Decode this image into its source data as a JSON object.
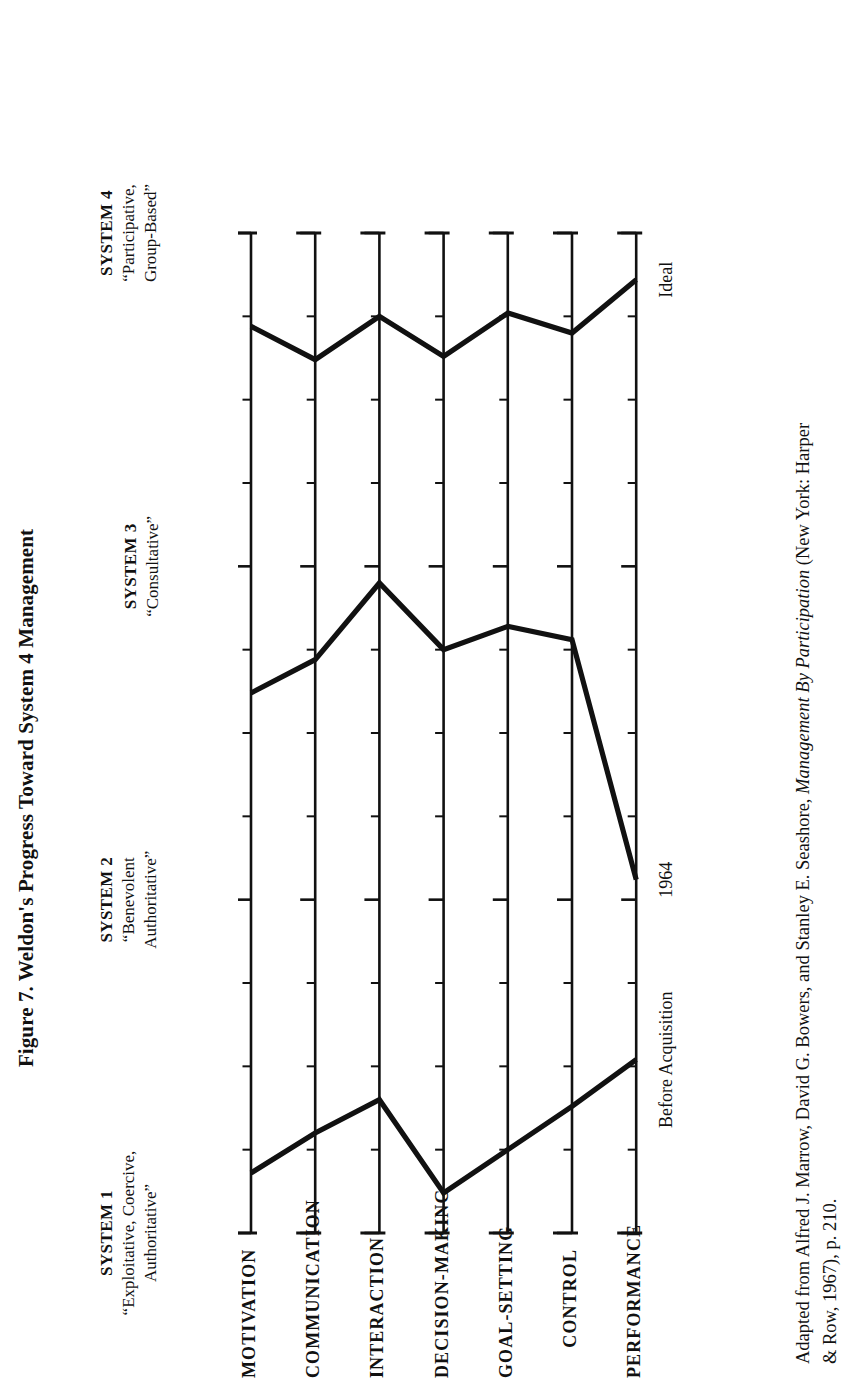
{
  "figure": {
    "title": "Figure 7. Weldon's Progress Toward System 4 Management",
    "orientation": "rotated-90-ccw",
    "ink_color": "#111111",
    "background_color": "#ffffff"
  },
  "systems": [
    {
      "name": "SYSTEM 1",
      "descriptor": "“Exploitative, Coercive,\nAuthoritative”"
    },
    {
      "name": "SYSTEM 2",
      "descriptor": "“Benevolent\nAuthoritative”"
    },
    {
      "name": "SYSTEM 3",
      "descriptor": "“Consultative”"
    },
    {
      "name": "SYSTEM 4",
      "descriptor": "“Participative,\nGroup-Based”"
    }
  ],
  "series_labels": {
    "ideal": "Ideal",
    "year_1964": "1964",
    "before_acquisition": "Before Acquisition"
  },
  "source": {
    "line1": "Adapted from Alfred J. Marrow, David G. Bowers, and Stanley E. Seashore, ",
    "line1_italic": "Management By Participation",
    "line1_tail": " (New York: Harper",
    "line2": "& Row, 1967), p. 210."
  },
  "chart_data": {
    "type": "line",
    "title": "Figure 7. Weldon's Progress Toward System 4 Management",
    "xlabel": "",
    "ylabel": "",
    "orientation": "horizontal-profile",
    "note": "Likert System 1-4 organizational profile. The value axis runs 1.0 (System 1) to 4.0 (System 4) and is drawn horizontally for each variable row; each row is a separate vertical scale in the rotated scan.",
    "xlim": [
      1.0,
      4.0
    ],
    "grid": false,
    "major_ticks": [
      1.0,
      2.0,
      3.0,
      4.0
    ],
    "minor_tick_step": 0.25,
    "categories": [
      "MOTIVATION",
      "COMMUNICATION",
      "INTERACTION",
      "DECISION-MAKING",
      "GOAL-SETTING",
      "CONTROL",
      "PERFORMANCE"
    ],
    "series": [
      {
        "name": "Before Acquisition",
        "endpoint_label": "Before Acquisition",
        "values": [
          1.18,
          1.3,
          1.4,
          1.12,
          1.25,
          1.38,
          1.52
        ]
      },
      {
        "name": "1964",
        "endpoint_label": "1964",
        "values": [
          2.62,
          2.72,
          2.95,
          2.75,
          2.82,
          2.78,
          2.06
        ]
      },
      {
        "name": "Ideal",
        "endpoint_label": "Ideal",
        "values": [
          3.72,
          3.62,
          3.75,
          3.63,
          3.76,
          3.7,
          3.86
        ]
      }
    ],
    "legend_position": "at-right-endpoints",
    "axis_labels": [
      {
        "value": 1.0,
        "label": "SYSTEM 1",
        "descriptor": "“Exploitative, Coercive, Authoritative”"
      },
      {
        "value": 2.0,
        "label": "SYSTEM 2",
        "descriptor": "“Benevolent Authoritative”"
      },
      {
        "value": 3.0,
        "label": "SYSTEM 3",
        "descriptor": "“Consultative”"
      },
      {
        "value": 4.0,
        "label": "SYSTEM 4",
        "descriptor": "“Participative, Group-Based”"
      }
    ]
  }
}
